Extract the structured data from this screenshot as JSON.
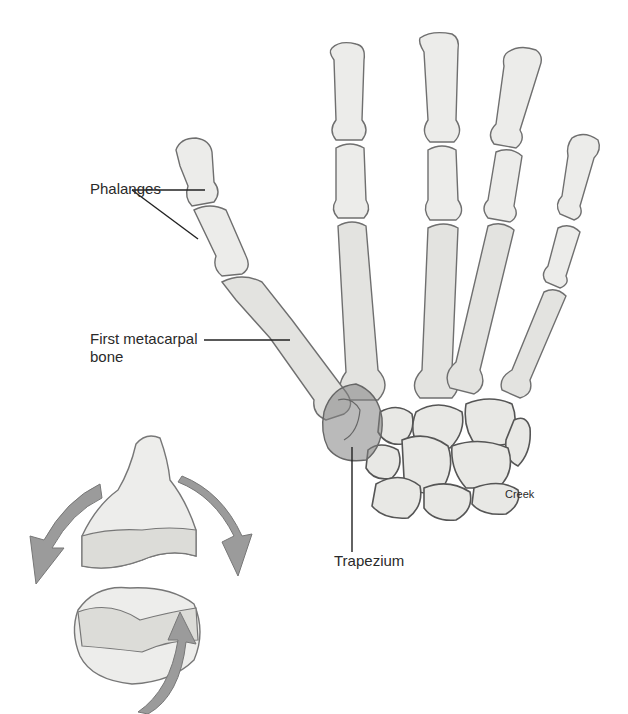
{
  "labels": {
    "phalanges": "Phalanges",
    "first_metacarpal_line1": "First metacarpal",
    "first_metacarpal_line2": "bone",
    "trapezium": "Trapezium",
    "signature": "Creek"
  },
  "colors": {
    "background": "#ffffff",
    "bone_fill": "#ececea",
    "outline": "#6f6f6f",
    "trapezium_shade": "#8c8c8c",
    "arrow_gray": "#9b9b9b",
    "label_text": "#2a2a2a"
  }
}
